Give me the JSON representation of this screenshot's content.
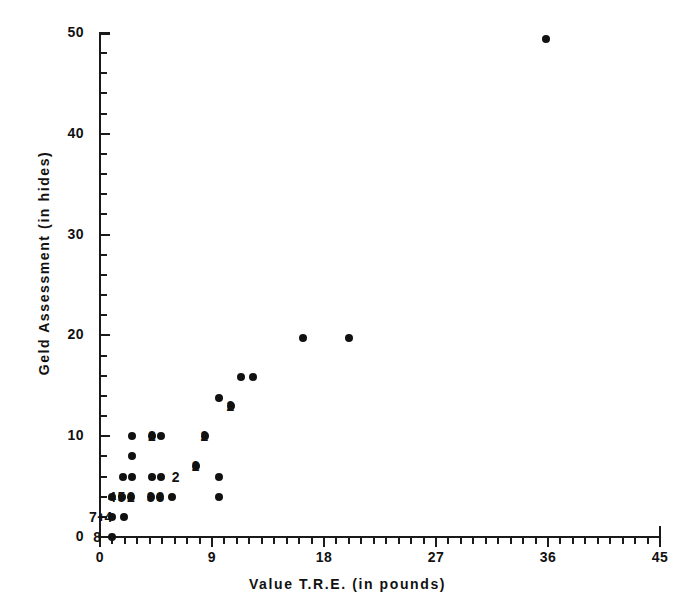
{
  "chart_data": {
    "type": "scatter",
    "title": "",
    "xlabel": "Value T.R.E. (in pounds)",
    "ylabel": "Geld Assessment (in hides)",
    "xlim": [
      0,
      45
    ],
    "ylim": [
      0,
      50
    ],
    "xticks": [
      0,
      9,
      18,
      27,
      36,
      45
    ],
    "yticks": [
      0,
      10,
      20,
      30,
      40,
      50
    ],
    "xticklabels": [
      "0",
      "9",
      "18",
      "27",
      "36",
      "45"
    ],
    "yticklabels": [
      "0",
      "10",
      "20",
      "30",
      "40",
      "50"
    ],
    "x_minor_tick_step": 1,
    "y_minor_tick_step": 2,
    "grid": false,
    "legend": null,
    "marker": "filled-circle",
    "marker_color": "#111111",
    "axis_color": "#1a1a1a",
    "background": "#ffffff",
    "spines": [
      "left",
      "bottom"
    ],
    "note": "Numeric labels beside markers give the number of coincident observations at that location.",
    "points": [
      {
        "x": 1.0,
        "y": 0.0,
        "count": 8,
        "label": "8",
        "label_side": "left"
      },
      {
        "x": 1.9,
        "y": 2.0,
        "count": 4,
        "label": "4",
        "label_side": "left"
      },
      {
        "x": 1.0,
        "y": 2.0,
        "count": 7,
        "label": "7",
        "label_side": "left",
        "plus": true
      },
      {
        "x": 1.0,
        "y": 4.0,
        "count": 4,
        "label": "4",
        "label_side": "none"
      },
      {
        "x": 1.75,
        "y": 4.0,
        "count": 5,
        "label": "5",
        "label_side": "none"
      },
      {
        "x": 2.5,
        "y": 4.0,
        "count": 2,
        "label": "2",
        "label_side": "none"
      },
      {
        "x": 4.1,
        "y": 4.0,
        "count": 3,
        "label": "3",
        "label_side": "none"
      },
      {
        "x": 4.85,
        "y": 4.0,
        "count": 3,
        "label": "3",
        "label_side": "none"
      },
      {
        "x": 5.8,
        "y": 4.0,
        "count": 1,
        "label": "",
        "label_side": "none"
      },
      {
        "x": 9.6,
        "y": 4.0,
        "count": 1,
        "label": "",
        "label_side": "none"
      },
      {
        "x": 1.85,
        "y": 6.0,
        "count": 1,
        "label": "",
        "label_side": "none"
      },
      {
        "x": 2.6,
        "y": 6.0,
        "count": 1,
        "label": "",
        "label_side": "none"
      },
      {
        "x": 4.2,
        "y": 6.0,
        "count": 1,
        "label": "",
        "label_side": "none"
      },
      {
        "x": 4.9,
        "y": 6.0,
        "count": 2,
        "label": "2",
        "label_side": "right"
      },
      {
        "x": 9.6,
        "y": 6.0,
        "count": 1,
        "label": "",
        "label_side": "none"
      },
      {
        "x": 2.6,
        "y": 8.0,
        "count": 1,
        "label": "",
        "label_side": "none"
      },
      {
        "x": 7.7,
        "y": 7.0,
        "count": 2,
        "label": "2",
        "label_side": "none"
      },
      {
        "x": 2.6,
        "y": 10.0,
        "count": 1,
        "label": "",
        "label_side": "none"
      },
      {
        "x": 4.2,
        "y": 10.0,
        "count": 2,
        "label": "2",
        "label_side": "none"
      },
      {
        "x": 4.9,
        "y": 10.0,
        "count": 1,
        "label": "",
        "label_side": "none"
      },
      {
        "x": 8.4,
        "y": 10.0,
        "count": 2,
        "label": "2",
        "label_side": "none"
      },
      {
        "x": 9.6,
        "y": 13.8,
        "count": 1,
        "label": "",
        "label_side": "none"
      },
      {
        "x": 10.5,
        "y": 13.0,
        "count": 2,
        "label": "2",
        "label_side": "none"
      },
      {
        "x": 11.3,
        "y": 15.9,
        "count": 1,
        "label": "",
        "label_side": "none"
      },
      {
        "x": 12.3,
        "y": 15.9,
        "count": 1,
        "label": "",
        "label_side": "none"
      },
      {
        "x": 16.3,
        "y": 19.7,
        "count": 1,
        "label": "",
        "label_side": "none"
      },
      {
        "x": 20.0,
        "y": 19.7,
        "count": 1,
        "label": "",
        "label_side": "none"
      },
      {
        "x": 35.8,
        "y": 49.4,
        "count": 1,
        "label": "",
        "label_side": "none"
      }
    ]
  }
}
